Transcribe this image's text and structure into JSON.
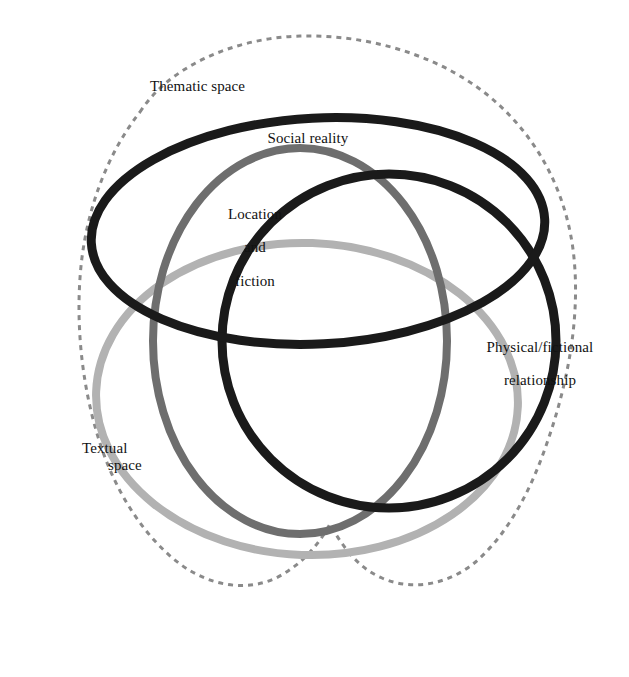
{
  "diagram": {
    "background_color": "#ffffff",
    "width": 629,
    "height": 677,
    "labels": {
      "thematic_space": "Thematic space",
      "social_reality": "Social reality",
      "location_and_fiction_line1": "Location",
      "location_and_fiction_line2": "and",
      "location_and_fiction_line3": "fiction",
      "physical_fictional_line1": "Physical/fictional",
      "physical_fictional_line2": "relationship",
      "textual_space_line1": "Textual",
      "textual_space_line2": "space"
    },
    "shapes": [
      {
        "name": "thematic-space-boundary",
        "label": "Thematic space",
        "style": "dashed",
        "color": "#8a8a8a",
        "stroke_width": 3,
        "dash_pattern": "5 5",
        "form": "irregular-cloud"
      },
      {
        "name": "social-reality-ellipse",
        "label": "Social reality",
        "style": "solid",
        "color": "#1a1a1a",
        "stroke_width": 9,
        "form": "wide-ellipse",
        "cx": 318,
        "cy": 231,
        "rx": 227,
        "ry": 113,
        "rotation": -3
      },
      {
        "name": "location-and-fiction-circle",
        "label": "Location and fiction",
        "style": "solid",
        "color": "#6e6e6e",
        "stroke_width": 8,
        "form": "circle",
        "cx": 300,
        "cy": 341,
        "rx": 147,
        "ry": 193,
        "rotation": 0
      },
      {
        "name": "physical-fictional-circle",
        "label": "Physical/fictional relationship",
        "style": "solid",
        "color": "#1a1a1a",
        "stroke_width": 9,
        "form": "circle",
        "cx": 389,
        "cy": 341,
        "rx": 167,
        "ry": 167,
        "rotation": 0
      },
      {
        "name": "textual-space-ellipse",
        "label": "Textual space",
        "style": "solid",
        "color": "#b2b2b2",
        "stroke_width": 8,
        "form": "wide-ellipse",
        "cx": 307,
        "cy": 399,
        "rx": 211,
        "ry": 156,
        "rotation": 2
      }
    ],
    "colors": {
      "black_ring": "#1a1a1a",
      "mid_gray_ring": "#6e6e6e",
      "light_gray_ring": "#b2b2b2",
      "dashed_boundary": "#8a8a8a",
      "text": "#111111",
      "background": "#ffffff"
    }
  }
}
